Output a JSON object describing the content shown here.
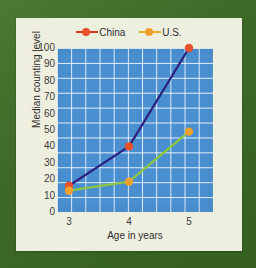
{
  "chart_data": {
    "type": "line",
    "title": "",
    "xlabel": "Age in years",
    "ylabel": "Median counting level",
    "x": [
      3,
      4,
      5
    ],
    "xticklabels": [
      "3",
      "4",
      "5"
    ],
    "xlim": [
      2.8,
      5.4
    ],
    "ylim": [
      0,
      100
    ],
    "yticks": [
      0,
      10,
      20,
      30,
      40,
      50,
      60,
      70,
      80,
      90,
      100
    ],
    "yticklabels": [
      "0",
      "10",
      "20",
      "30",
      "40",
      "50",
      "60",
      "70",
      "80",
      "90",
      "100"
    ],
    "grid": true,
    "legend_position": "top-center",
    "series": [
      {
        "name": "China",
        "values": [
          16,
          40,
          100
        ],
        "line_color": "#2b2080",
        "marker_color": "#e8512b"
      },
      {
        "name": "U.S.",
        "values": [
          13,
          18.5,
          49
        ],
        "line_color": "#8dc63f",
        "marker_color": "#f0a22e"
      }
    ]
  },
  "legend": {
    "entries": [
      {
        "label": "China",
        "line_color": "#d33a1f",
        "marker_color": "#e8512b"
      },
      {
        "label": "U.S.",
        "line_color": "#e8b423",
        "marker_color": "#f0a22e"
      }
    ]
  },
  "colors": {
    "frame": "#3e6b28",
    "card": "#efefe0",
    "plot_background": "#4a8fd0",
    "gridline": "#ffffff"
  }
}
